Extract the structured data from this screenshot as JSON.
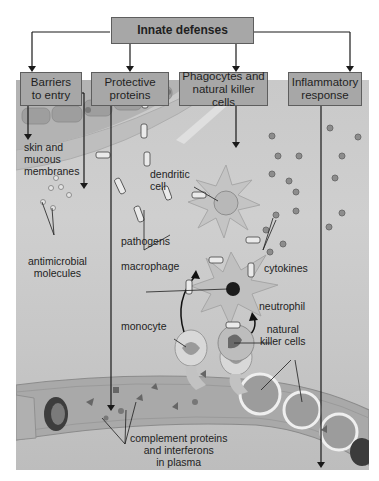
{
  "title": "Innate defenses",
  "categories": [
    {
      "id": "barriers",
      "label": "Barriers\nto entry"
    },
    {
      "id": "proteins",
      "label": "Protective\nproteins"
    },
    {
      "id": "phagocytes",
      "label": "Phagocytes and\nnatural killer cells"
    },
    {
      "id": "inflammatory",
      "label": "Inflammatory\nresponse"
    }
  ],
  "annotations": {
    "skin": "skin and\nmucous\nmembranes",
    "dendritic": "dendritic\ncell",
    "pathogens": "pathogens",
    "antimicrobial": "antimicrobial\nmolecules",
    "macrophage": "macrophage",
    "cytokines": "cytokines",
    "neutrophil": "neutrophil",
    "monocyte": "monocyte",
    "natural_killer": "natural\nkiller cells",
    "complement": "complement proteins\nand interferons\nin plasma"
  },
  "colors": {
    "box_fill": "#a7a7a7",
    "box_border": "#5e5e5e",
    "scene_bg": "#c9c9c9",
    "arrow": "#1a1a1a"
  }
}
